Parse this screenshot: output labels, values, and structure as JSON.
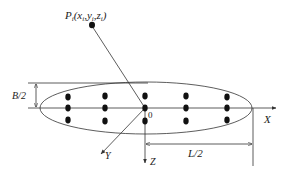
{
  "diagram": {
    "point": {
      "name": "P",
      "subscript": "i",
      "coords_text": "(x_i, y_i, z_i)",
      "label_parts": [
        "P",
        "i",
        "(x",
        "i",
        ",y",
        "i",
        ",z",
        "i",
        ")"
      ]
    },
    "origin_label": "0",
    "axes": {
      "x": "X",
      "y": "Y",
      "z": "Z"
    },
    "dimensions": {
      "half_width": "B/2",
      "half_length": "L/2"
    },
    "source_grid": {
      "columns": 5,
      "rows": 3,
      "column_x": [
        68,
        105,
        145,
        186,
        227
      ],
      "row_y": [
        96,
        108,
        121
      ]
    },
    "colors": {
      "stroke": "#333333",
      "dot": "#111111",
      "background": "#ffffff"
    }
  }
}
